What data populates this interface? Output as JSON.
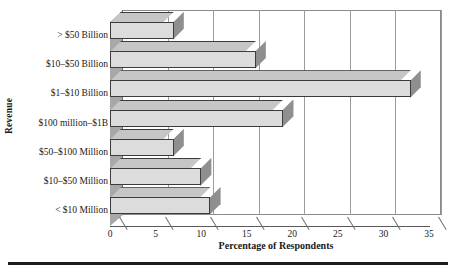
{
  "chart_data": {
    "type": "bar",
    "orientation": "horizontal",
    "title": "",
    "xlabel": "Percentage of Respondents",
    "ylabel": "Revenue",
    "categories": [
      "> $50 Billion",
      "$10–$50 Billion",
      "$1–$10 Billion",
      "$100 million–$1B",
      "$50–$100 Million",
      "$10–$50 Million",
      "< $10 Million"
    ],
    "values": [
      7,
      16,
      33,
      19,
      7,
      10,
      11
    ],
    "xlim": [
      0,
      35
    ],
    "xticks": [
      0,
      5,
      10,
      15,
      20,
      25,
      30,
      35
    ],
    "xtick_labels": [
      "0",
      "5",
      "10",
      "15",
      "20",
      "25",
      "30",
      "35"
    ],
    "grid": "vertical",
    "legend": "none",
    "style": "3d-bars",
    "colors": {
      "bar_face": "#dcdcdc",
      "bar_top": "#c6c6c6",
      "bar_side": "#8f8f8f",
      "bar_edge": "#3c3c3c",
      "gridline": "#9b9b9b",
      "wall": "#a8a8a8",
      "rule": "#1c1c1c",
      "text": "#1a1a1a",
      "background": "#ffffff"
    }
  },
  "figure": {
    "bottom_rule": ""
  }
}
